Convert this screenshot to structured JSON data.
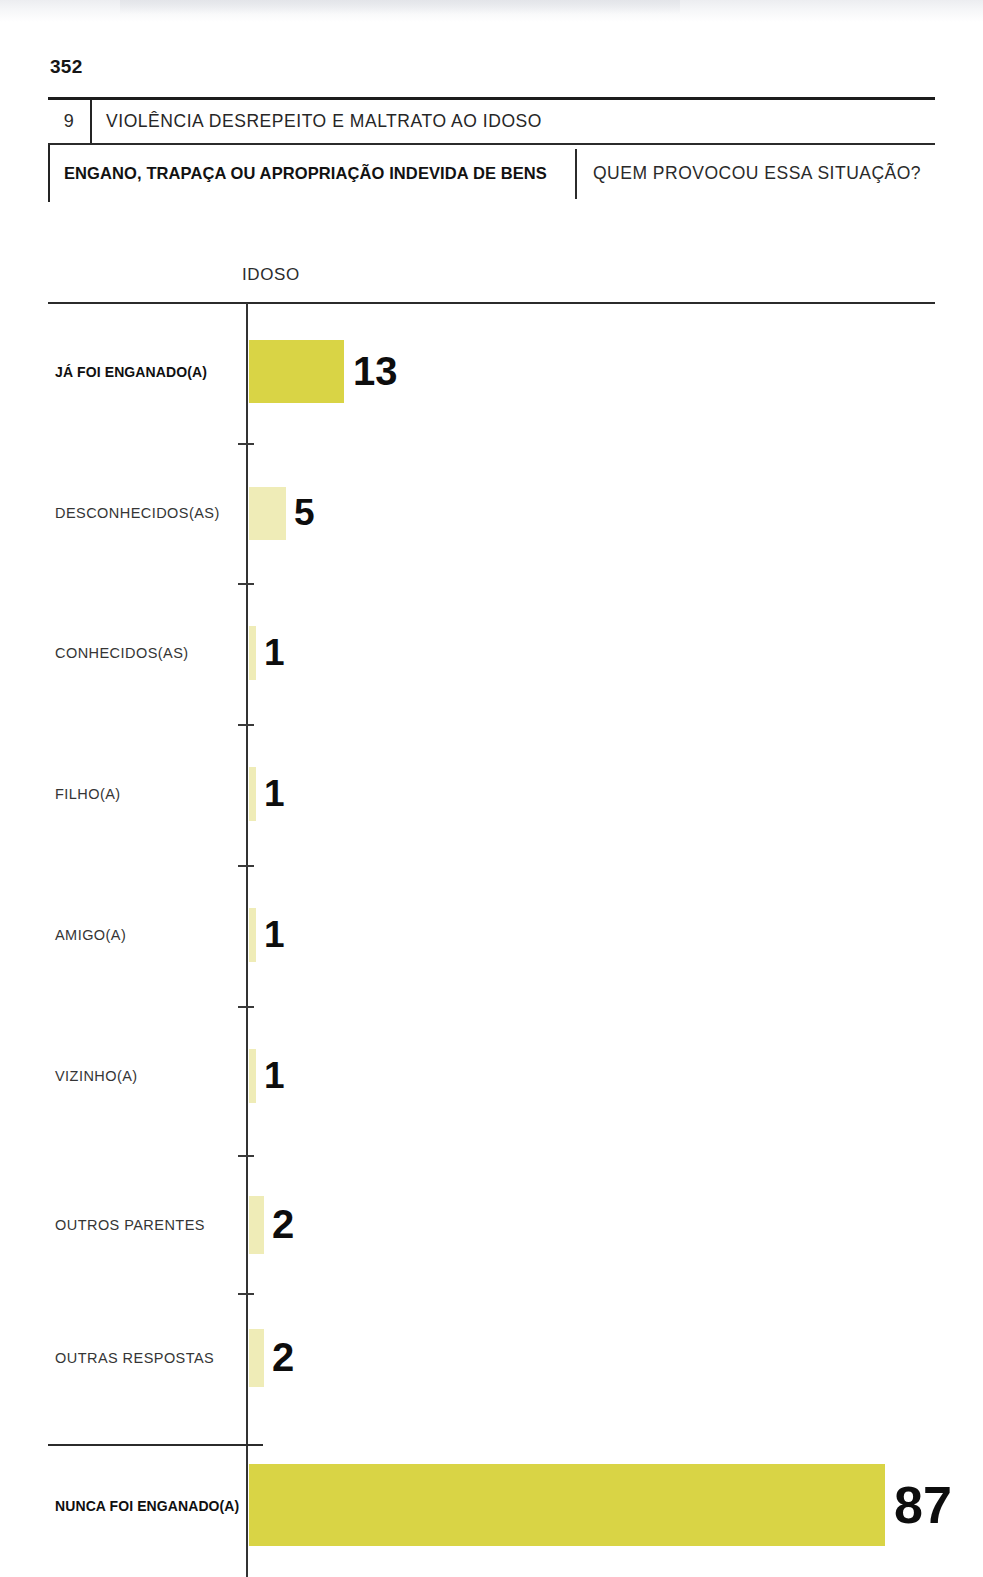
{
  "page": {
    "number": "352"
  },
  "header": {
    "chapter_number": "9",
    "chapter_title": "VIOLÊNCIA DESREPEITO E MALTRATO AO IDOSO",
    "section_title": "ENGANO, TRAPAÇA OU APROPRIAÇÃO INDEVIDA DE BENS",
    "question": "QUEM PROVOCOU ESSA SITUAÇÃO?"
  },
  "chart_data": {
    "type": "bar",
    "orientation": "horizontal",
    "title": "ENGANO, TRAPAÇA OU APROPRIAÇÃO INDEVIDA DE BENS",
    "subtitle": "QUEM PROVOCOU ESSA SITUAÇÃO?",
    "series_label": "IDOSO",
    "xlabel": "",
    "ylabel": "",
    "xlim": [
      0,
      100
    ],
    "grid": false,
    "legend": "none",
    "colors": {
      "primary_bar": "#D9D445",
      "secondary_bar": "#EFECB7",
      "value_text": "#0d0d0d",
      "axis": "#333333"
    },
    "categories": [
      "JÁ FOI ENGANADO(A)",
      "DESCONHECIDOS(AS)",
      "CONHECIDOS(AS)",
      "FILHO(A)",
      "AMIGO(A)",
      "VIZINHO(A)",
      "OUTROS PARENTES",
      "OUTRAS RESPOSTAS",
      "NUNCA FOI ENGANADO(A)"
    ],
    "values": [
      13,
      5,
      1,
      1,
      1,
      1,
      2,
      2,
      87
    ],
    "bars": [
      {
        "label": "JÁ FOI ENGANADO(A)",
        "value": 13,
        "value_text": "13",
        "emphasis": "primary",
        "group": "main"
      },
      {
        "label": "DESCONHECIDOS(AS)",
        "value": 5,
        "value_text": "5",
        "emphasis": "secondary",
        "group": "breakdown"
      },
      {
        "label": "CONHECIDOS(AS)",
        "value": 1,
        "value_text": "1",
        "emphasis": "secondary",
        "group": "breakdown"
      },
      {
        "label": "FILHO(A)",
        "value": 1,
        "value_text": "1",
        "emphasis": "secondary",
        "group": "breakdown"
      },
      {
        "label": "AMIGO(A)",
        "value": 1,
        "value_text": "1",
        "emphasis": "secondary",
        "group": "breakdown"
      },
      {
        "label": "VIZINHO(A)",
        "value": 1,
        "value_text": "1",
        "emphasis": "secondary",
        "group": "breakdown"
      },
      {
        "label": "OUTROS PARENTES",
        "value": 2,
        "value_text": "2",
        "emphasis": "secondary",
        "group": "breakdown"
      },
      {
        "label": "OUTRAS RESPOSTAS",
        "value": 2,
        "value_text": "2",
        "emphasis": "secondary",
        "group": "breakdown"
      },
      {
        "label": "NUNCA FOI ENGANADO(A)",
        "value": 87,
        "value_text": "87",
        "emphasis": "primary",
        "group": "main"
      }
    ]
  },
  "layout": {
    "axis_x": 246,
    "bar_start_x": 249,
    "px_per_unit": 7.31,
    "rows": [
      {
        "center_y": 372,
        "bar_top": 340,
        "bar_height": 63,
        "value_size": 40,
        "value_gap": 9
      },
      {
        "center_y": 513,
        "bar_top": 487,
        "bar_height": 53,
        "value_size": 37,
        "value_gap": 8
      },
      {
        "center_y": 653,
        "bar_top": 626,
        "bar_height": 54,
        "value_size": 37,
        "value_gap": 8
      },
      {
        "center_y": 794,
        "bar_top": 767,
        "bar_height": 54,
        "value_size": 37,
        "value_gap": 8
      },
      {
        "center_y": 935,
        "bar_top": 908,
        "bar_height": 54,
        "value_size": 37,
        "value_gap": 8
      },
      {
        "center_y": 1076,
        "bar_top": 1049,
        "bar_height": 54,
        "value_size": 37,
        "value_gap": 8
      },
      {
        "center_y": 1225,
        "bar_top": 1196,
        "bar_height": 58,
        "value_size": 40,
        "value_gap": 8
      },
      {
        "center_y": 1358,
        "bar_top": 1329,
        "bar_height": 58,
        "value_size": 40,
        "value_gap": 8
      },
      {
        "center_y": 1506,
        "bar_top": 1464,
        "bar_height": 82,
        "value_size": 52,
        "value_gap": 9
      }
    ],
    "ticks_y": [
      443,
      583,
      724,
      865,
      1006,
      1155,
      1293,
      1444
    ]
  }
}
